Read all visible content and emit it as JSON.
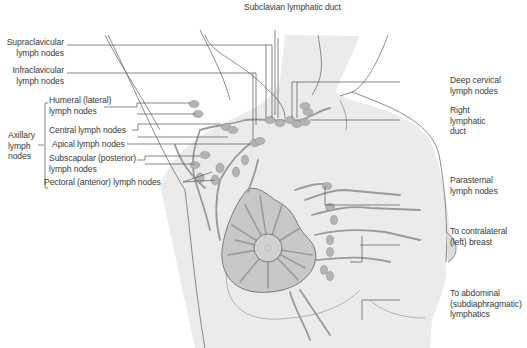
{
  "diagram": {
    "colors": {
      "skin": "#ebebeb",
      "outline": "#6e6e6e",
      "vessel": "#9a9a9a",
      "node_fill": "#b4b4b4",
      "areola_fill": "#c8c8c8",
      "leader_line": "#555555",
      "text": "#3a3a3a"
    },
    "labels": {
      "subclavian_duct": "Subclavian lymphatic duct",
      "supraclavicular": [
        "Supraclavicular",
        "lymph nodes"
      ],
      "infraclavicular": [
        "Infraclavicular",
        "lymph nodes"
      ],
      "axillary_group": [
        "Axillary",
        "lymph",
        "nodes"
      ],
      "humeral": [
        "Humeral (lateral)",
        "lymph nodes"
      ],
      "central": "Central lymph nodes",
      "apical": "Apical lymph nodes",
      "subscapular": [
        "Subscapular (posterior)",
        "lymph nodes"
      ],
      "pectoral": "Pectoral (anterior) lymph nodes",
      "deep_cervical": [
        "Deep cervical",
        "lymph nodes"
      ],
      "right_lymphatic_duct": [
        "Right",
        "lymphatic",
        "duct"
      ],
      "parasternal": [
        "Parasternal",
        "lymph nodes"
      ],
      "contralateral": [
        "To contralateral",
        "(left) breast"
      ],
      "abdominal": [
        "To abdominal",
        "(subdiaphragmatic)",
        "lymphatics"
      ]
    }
  }
}
